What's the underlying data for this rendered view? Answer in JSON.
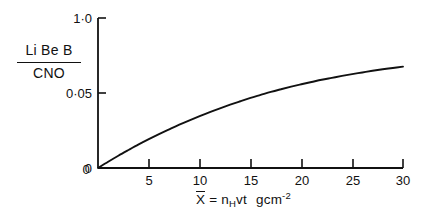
{
  "figure": {
    "background_color": "#ffffff",
    "line_color": "#111111",
    "axis_color": "#111111"
  },
  "axes": {
    "y_axis_label_numerator": "Li Be B",
    "y_axis_label_denominator": "CNO",
    "x_axis_label_parts": {
      "variable": "X",
      "equals": "=",
      "n_symbol": "n",
      "n_subscript": "H",
      "vt": "vt",
      "units_base": "gcm",
      "units_exponent": "-2"
    },
    "x_axis_label_plain": "X̄ = n_H vt   gcm⁻²",
    "y_tick_labels": [
      "0",
      "0·05",
      "1·0"
    ],
    "x_tick_labels": [
      "0",
      "5",
      "10",
      "15",
      "20",
      "25",
      "30"
    ]
  },
  "chart_data": {
    "type": "line",
    "title": "",
    "xlabel": "X̄ = n_H vt   gcm⁻²",
    "ylabel": "Li Be B / CNO",
    "xlim": [
      0,
      30
    ],
    "ylim": [
      0,
      1.0
    ],
    "grid": false,
    "legend": null,
    "x_ticks": [
      0,
      5,
      10,
      15,
      20,
      25,
      30
    ],
    "x_tick_labels": [
      "0",
      "5",
      "10",
      "15",
      "20",
      "25",
      "30"
    ],
    "y_ticks": [
      0,
      0.5,
      1.0
    ],
    "y_tick_labels": [
      "0",
      "0·5",
      "1·0"
    ],
    "series": [
      {
        "name": "Li Be B / CNO vs X̄",
        "x": [
          0,
          1,
          2,
          3,
          4,
          5,
          6,
          7,
          8,
          9,
          10,
          11,
          12,
          13,
          14,
          15,
          16,
          17,
          18,
          19,
          20,
          21,
          22,
          23,
          24,
          25,
          26,
          27,
          28,
          29,
          30
        ],
        "y": [
          0.0,
          0.042,
          0.082,
          0.12,
          0.157,
          0.192,
          0.226,
          0.258,
          0.289,
          0.318,
          0.346,
          0.373,
          0.398,
          0.422,
          0.445,
          0.467,
          0.487,
          0.507,
          0.525,
          0.542,
          0.558,
          0.573,
          0.588,
          0.601,
          0.614,
          0.626,
          0.637,
          0.648,
          0.658,
          0.667,
          0.676
        ]
      }
    ]
  }
}
